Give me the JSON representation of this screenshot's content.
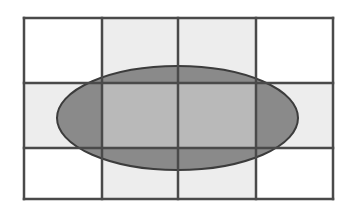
{
  "diagram": {
    "grid": {
      "rows": 3,
      "cols": 4,
      "x_lines": [
        24,
        102,
        178,
        256,
        333
      ],
      "y_lines": [
        18,
        83,
        148,
        199
      ],
      "line_color": "#4a4a4a",
      "line_width": 2.5
    },
    "cell_fills": [
      [
        "#ffffff",
        "#ededed",
        "#ededed",
        "#ffffff"
      ],
      [
        "#ededed",
        "#b9b9b9",
        "#b9b9b9",
        "#ededed"
      ],
      [
        "#ffffff",
        "#ededed",
        "#ededed",
        "#ffffff"
      ]
    ],
    "ellipse": {
      "cx": 177.5,
      "cy": 118,
      "rx": 120.5,
      "ry": 52,
      "fill": "#8a8a8a",
      "stroke": "#3c3c3c",
      "stroke_width": 2
    },
    "colors": {
      "background": "#ffffff",
      "light_cell": "#ededed",
      "inner_cell": "#b9b9b9",
      "ellipse_fill": "#8a8a8a",
      "outline": "#4a4a4a"
    }
  }
}
